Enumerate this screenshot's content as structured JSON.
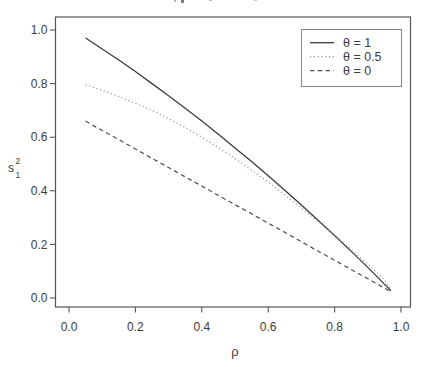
{
  "figure": {
    "x_axis": {
      "label": "ρ",
      "ticks": [
        "0.0",
        "0.2",
        "0.4",
        "0.6",
        "0.8",
        "1.0"
      ]
    },
    "y_axis": {
      "label_base": "s",
      "label_sup": "2",
      "label_sub": "1",
      "ticks": [
        "0.0",
        "0.2",
        "0.4",
        "0.6",
        "0.8",
        "1.0"
      ]
    },
    "legend": {
      "entries": [
        {
          "label": "θ = 1",
          "style": "solid"
        },
        {
          "label": "θ = 0.5",
          "style": "dotted"
        },
        {
          "label": "θ = 0",
          "style": "dashed"
        }
      ]
    }
  },
  "chart_data": {
    "type": "line",
    "title": "",
    "xlabel": "ρ",
    "ylabel": "s_1^2",
    "xlim": [
      0,
      1
    ],
    "ylim": [
      0,
      1
    ],
    "grid": false,
    "legend_position": "top-right",
    "x": [
      0.05,
      0.1,
      0.15,
      0.2,
      0.25,
      0.3,
      0.35,
      0.4,
      0.45,
      0.5,
      0.55,
      0.6,
      0.65,
      0.7,
      0.75,
      0.8,
      0.85,
      0.9,
      0.95,
      0.97
    ],
    "series": [
      {
        "name": "θ = 1",
        "style": "solid",
        "values": [
          0.97,
          0.929,
          0.888,
          0.845,
          0.8,
          0.755,
          0.708,
          0.66,
          0.611,
          0.56,
          0.509,
          0.456,
          0.402,
          0.347,
          0.29,
          0.233,
          0.174,
          0.114,
          0.052,
          0.027
        ]
      },
      {
        "name": "θ = 0.5",
        "style": "dotted",
        "values": [
          0.795,
          0.775,
          0.752,
          0.727,
          0.7,
          0.669,
          0.636,
          0.6,
          0.561,
          0.52,
          0.477,
          0.432,
          0.385,
          0.336,
          0.286,
          0.234,
          0.181,
          0.126,
          0.069,
          0.03
        ]
      },
      {
        "name": "θ = 0",
        "style": "dashed",
        "values": [
          0.66,
          0.625,
          0.591,
          0.556,
          0.521,
          0.487,
          0.452,
          0.418,
          0.383,
          0.348,
          0.314,
          0.279,
          0.245,
          0.21,
          0.175,
          0.141,
          0.106,
          0.072,
          0.037,
          0.022
        ]
      }
    ]
  },
  "colors": {
    "background": "#ffffff",
    "solid_line": "#3c3c3c",
    "dotted_line": "#979797",
    "dashed_line": "#4f4f4f",
    "axis": "#555555",
    "text": "#3c3c3c"
  }
}
